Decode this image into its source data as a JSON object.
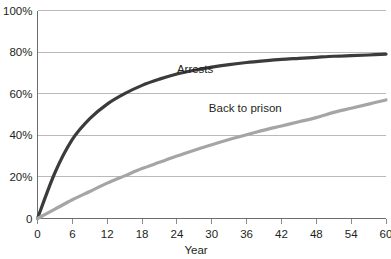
{
  "chart_data": {
    "type": "line",
    "title": "",
    "xlabel": "Year",
    "ylabel": "",
    "xlim": [
      0,
      60
    ],
    "ylim": [
      0,
      100
    ],
    "grid": true,
    "legend_position": "inline-annotation",
    "x_ticks": [
      "0",
      "6",
      "12",
      "18",
      "24",
      "30",
      "36",
      "42",
      "48",
      "54",
      "60"
    ],
    "y_ticks": [
      "0",
      "20%",
      "40%",
      "60%",
      "80%",
      "100%"
    ],
    "x_tick_values": [
      0,
      6,
      12,
      18,
      24,
      30,
      36,
      42,
      48,
      54,
      60
    ],
    "y_tick_values": [
      0,
      20,
      40,
      60,
      80,
      100
    ],
    "x": [
      0,
      3,
      6,
      9,
      12,
      15,
      18,
      21,
      24,
      27,
      30,
      33,
      36,
      39,
      42,
      45,
      48,
      51,
      54,
      57,
      60
    ],
    "series": [
      {
        "name": "Arrests",
        "color": "#3b3b3b",
        "width": 3.2,
        "label_x": 24,
        "label_y": 70,
        "values": [
          0,
          22,
          38,
          48,
          55,
          60,
          64,
          67,
          69.5,
          71.3,
          72.8,
          74,
          75,
          75.8,
          76.5,
          77,
          77.5,
          78,
          78.3,
          78.6,
          79
        ]
      },
      {
        "name": "Back to prison",
        "color": "#a5a5a5",
        "width": 3.2,
        "label_x": 29.5,
        "label_y": 51,
        "values": [
          0,
          4.5,
          9,
          13,
          17,
          20.5,
          24,
          27,
          30,
          32.8,
          35.5,
          38,
          40.3,
          42.5,
          44.5,
          46.5,
          48.5,
          51,
          53,
          55,
          57
        ]
      }
    ]
  },
  "colors": {
    "grid": "#b9b9b9",
    "axis": "#6d6d6d",
    "text": "#231f20",
    "arrests": "#3b3b3b",
    "back_to_prison": "#a5a5a5",
    "background": "#ffffff"
  }
}
